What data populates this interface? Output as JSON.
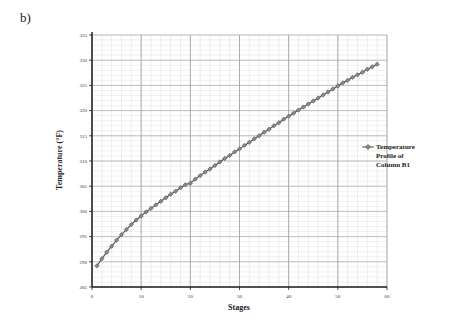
{
  "panel_label": "b)",
  "chart_data": {
    "type": "line",
    "title": "",
    "xlabel": "Stages",
    "ylabel": "Temperature (°F)",
    "xlim": [
      0,
      60
    ],
    "ylim": [
      285,
      335
    ],
    "x_ticks": [
      0,
      10,
      20,
      30,
      40,
      50,
      60
    ],
    "y_ticks": [
      285,
      290,
      295,
      300,
      305,
      310,
      315,
      320,
      325,
      330,
      335
    ],
    "grid": true,
    "legend_position": "right",
    "series": [
      {
        "name": "Temperature Profile of Column B1",
        "marker": "diamond",
        "color": "#555555",
        "x": [
          1,
          2,
          3,
          4,
          5,
          6,
          7,
          8,
          9,
          10,
          11,
          12,
          13,
          14,
          15,
          16,
          17,
          18,
          19,
          20,
          21,
          22,
          23,
          24,
          25,
          26,
          27,
          28,
          29,
          30,
          31,
          32,
          33,
          34,
          35,
          36,
          37,
          38,
          39,
          40,
          41,
          42,
          43,
          44,
          45,
          46,
          47,
          48,
          49,
          50,
          51,
          52,
          53,
          54,
          55,
          56,
          57,
          58
        ],
        "values": [
          289.2,
          290.6,
          291.9,
          293.1,
          294.3,
          295.4,
          296.4,
          297.4,
          298.3,
          299.1,
          299.9,
          300.6,
          301.3,
          302.0,
          302.7,
          303.4,
          304.0,
          304.7,
          305.3,
          305.6,
          306.4,
          307.1,
          307.8,
          308.4,
          309.1,
          309.8,
          310.5,
          311.1,
          311.8,
          312.4,
          313.1,
          313.7,
          314.4,
          315.0,
          315.7,
          316.3,
          317.0,
          317.6,
          318.3,
          318.9,
          319.5,
          320.1,
          320.7,
          321.3,
          321.9,
          322.5,
          323.1,
          323.7,
          324.3,
          324.9,
          325.5,
          326.0,
          326.6,
          327.1,
          327.6,
          328.2,
          328.7,
          329.2
        ]
      }
    ]
  },
  "legend": {
    "lines": [
      "Temperature",
      "Profile of",
      "Column B1"
    ]
  }
}
